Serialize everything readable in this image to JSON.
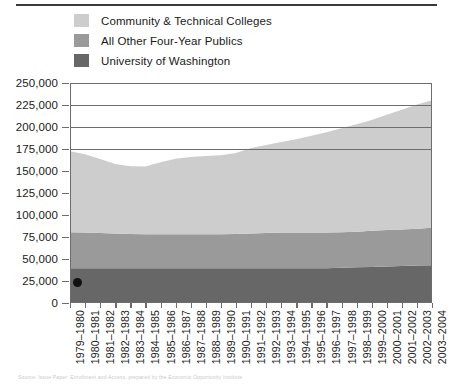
{
  "legend": {
    "items": [
      {
        "label": "Community & Technical Colleges",
        "color": "#cdcdcd",
        "name": "community-technical-colleges"
      },
      {
        "label": "All Other Four-Year Publics",
        "color": "#9a9a9a",
        "name": "all-other-four-year-publics"
      },
      {
        "label": "University of Washington",
        "color": "#676767",
        "name": "university-of-washington"
      }
    ]
  },
  "source_note": "Source: Issue Paper: Enrollment and Access, prepared by the Economic Opportunity Institute",
  "chart_data": {
    "type": "area",
    "stacked": true,
    "title": "",
    "subtitle": "",
    "xlabel": "",
    "ylabel": "",
    "ylim": [
      0,
      250000
    ],
    "ytick_values": [
      0,
      25000,
      50000,
      75000,
      100000,
      125000,
      150000,
      175000,
      200000,
      225000,
      250000
    ],
    "ytick_labels": [
      "0",
      "25,000",
      "50,000",
      "75,000",
      "100,000",
      "125,000",
      "150,000",
      "175,000",
      "200,000",
      "225,000",
      "250,000"
    ],
    "grid": true,
    "grid_axis": "y",
    "legend_position": "top-left",
    "categories": [
      "1979–1980",
      "1980–1981",
      "1981–1982",
      "1982–1983",
      "1983–1984",
      "1984–1985",
      "1985–1986",
      "1986–1987",
      "1987–1988",
      "1988–1989",
      "1989–1990",
      "1990–1991",
      "1991–1992",
      "1992–1993",
      "1993–1994",
      "1994–1995",
      "1995–1996",
      "1996–1997",
      "1997–1998",
      "1998–1999",
      "1999–2000",
      "2000–2001",
      "2001–2002",
      "2002–2003",
      "2003–2004"
    ],
    "series": [
      {
        "name": "University of Washington",
        "color": "#676767",
        "values": [
          39500,
          39500,
          39500,
          39500,
          39500,
          39500,
          39500,
          39500,
          39500,
          39500,
          39500,
          39500,
          39500,
          39500,
          39500,
          39500,
          39500,
          39500,
          40000,
          40500,
          41000,
          41500,
          42000,
          42500,
          43000
        ]
      },
      {
        "name": "All Other Four-Year Publics",
        "color": "#9a9a9a",
        "values": [
          41000,
          40500,
          40000,
          39500,
          39000,
          38500,
          38500,
          38500,
          38500,
          38500,
          38500,
          39000,
          39500,
          40000,
          40500,
          40500,
          40500,
          40500,
          40500,
          40500,
          41000,
          41500,
          41500,
          42000,
          42500
        ]
      },
      {
        "name": "Community & Technical Colleges",
        "color": "#cdcdcd",
        "values": [
          92000,
          89000,
          84000,
          79000,
          77000,
          77000,
          82000,
          86000,
          88000,
          89000,
          90000,
          92000,
          97000,
          100000,
          103000,
          106000,
          110000,
          114000,
          118000,
          122000,
          126000,
          131000,
          136000,
          141000,
          145000
        ]
      }
    ],
    "totals": [
      172500,
      169000,
      163500,
      158000,
      155500,
      155000,
      160000,
      164000,
      166000,
      167000,
      168000,
      170500,
      176000,
      179500,
      183000,
      186000,
      190000,
      194000,
      198500,
      203000,
      208000,
      214000,
      219500,
      225500,
      230500
    ],
    "annotations": [
      {
        "name": "start-point-marker",
        "x": "1979–1980",
        "y": 22000,
        "shape": "dot",
        "color": "#111111"
      }
    ]
  }
}
